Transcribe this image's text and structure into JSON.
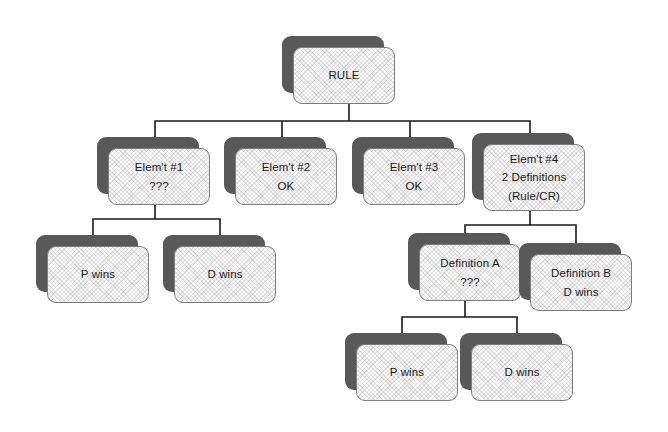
{
  "diagram": {
    "background_color": "#ffffff",
    "shadow_color": "#595959",
    "border_color": "#7d7d7d",
    "fill_color": "#fbfbfb",
    "line_color": "#1a1a1a",
    "text_color": "#1a1a1a"
  },
  "nodes": [
    {
      "id": "rule",
      "name": "rule",
      "lines": [
        "RULE"
      ],
      "x": 282,
      "y": 36,
      "w": 113,
      "h": 68
    },
    {
      "id": "elem1",
      "name": "element-1",
      "lines": [
        "Elem't #1",
        "???"
      ],
      "x": 97,
      "y": 137,
      "w": 113,
      "h": 68
    },
    {
      "id": "elem2",
      "name": "element-2",
      "lines": [
        "Elem't #2",
        "OK"
      ],
      "x": 224,
      "y": 137,
      "w": 113,
      "h": 68
    },
    {
      "id": "elem3",
      "name": "element-3",
      "lines": [
        "Elem't #3",
        "OK"
      ],
      "x": 352,
      "y": 137,
      "w": 113,
      "h": 68
    },
    {
      "id": "elem4",
      "name": "element-4",
      "lines": [
        "Elem't #4",
        "2 Definitions",
        "(Rule/CR)"
      ],
      "x": 472,
      "y": 133,
      "w": 113,
      "h": 78
    },
    {
      "id": "left-p-wins",
      "name": "left-p-wins",
      "lines": [
        "P wins"
      ],
      "x": 36,
      "y": 235,
      "w": 113,
      "h": 68
    },
    {
      "id": "left-d-wins",
      "name": "left-d-wins",
      "lines": [
        "D wins"
      ],
      "x": 163,
      "y": 235,
      "w": 113,
      "h": 68
    },
    {
      "id": "definition-a",
      "name": "definition-a",
      "lines": [
        "Definition A",
        "???"
      ],
      "x": 408,
      "y": 233,
      "w": 113,
      "h": 68
    },
    {
      "id": "definition-b",
      "name": "definition-b",
      "lines": [
        "Definition B",
        "D wins"
      ],
      "x": 519,
      "y": 243,
      "w": 113,
      "h": 68
    },
    {
      "id": "bottom-p-wins",
      "name": "bottom-p-wins",
      "lines": [
        "P wins"
      ],
      "x": 345,
      "y": 333,
      "w": 113,
      "h": 68
    },
    {
      "id": "bottom-d-wins",
      "name": "bottom-d-wins",
      "lines": [
        "D wins"
      ],
      "x": 460,
      "y": 333,
      "w": 113,
      "h": 68
    }
  ],
  "connectors": [
    {
      "name": "rule-to-elements",
      "parent": "rule",
      "path": "M 349 104 L 349 121 M 155 121 L 530 121 M 155 121 L 155 137 M 282 121 L 282 137 M 410 121 L 410 137 M 530 121 L 530 137"
    },
    {
      "name": "element-1-to-outcomes",
      "parent": "elem1",
      "path": "M 155 205 L 155 219 M 93 219 L 220 219 M 93 219 L 93 235 M 220 219 L 220 235"
    },
    {
      "name": "element-4-to-definitions",
      "parent": "elem4",
      "path": "M 530 211 L 530 225 M 465 225 L 576 225 M 465 225 L 465 233 M 576 225 L 576 243"
    },
    {
      "name": "definition-a-to-outcomes",
      "parent": "definition-a",
      "path": "M 465 301 L 465 317 M 402 317 L 517 317 M 402 317 L 402 333 M 517 317 L 517 333"
    }
  ]
}
